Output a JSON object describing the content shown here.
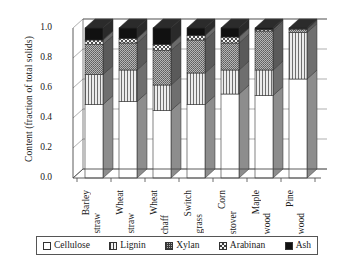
{
  "chart_data": {
    "type": "bar",
    "subtype": "stacked-bar-3d",
    "title": "",
    "xlabel": "",
    "ylabel": "Content (fraction of total solids)",
    "ylim": [
      0.0,
      1.0
    ],
    "yticks": [
      "0.0",
      "0.2",
      "0.4",
      "0.6",
      "0.8",
      "1.0"
    ],
    "ytick_values": [
      0.0,
      0.2,
      0.4,
      0.6,
      0.8,
      1.0
    ],
    "grid": true,
    "grid_axis": "y",
    "legend_position": "bottom",
    "stacked": true,
    "stack_total": 1.0,
    "categories": [
      "Barley straw",
      "Wheat straw",
      "Wheat chaff",
      "Switch grass",
      "Corn stover",
      "Maple wood",
      "Pine wood"
    ],
    "categories_lines": [
      [
        "Barley",
        "straw"
      ],
      [
        "Wheat",
        "straw"
      ],
      [
        "Wheat",
        "chaff"
      ],
      [
        "Switch",
        "grass"
      ],
      [
        "Corn",
        "stover"
      ],
      [
        "Maple",
        "wood"
      ],
      [
        "Pine",
        "wood"
      ]
    ],
    "series": [
      {
        "name": "Cellulose",
        "pattern": "solid-white",
        "color": "#ffffff",
        "values": [
          0.49,
          0.51,
          0.45,
          0.49,
          0.56,
          0.55,
          0.66
        ]
      },
      {
        "name": "Lignin",
        "pattern": "vertical-lines",
        "color": "#d8d8d8",
        "values": [
          0.2,
          0.21,
          0.17,
          0.21,
          0.16,
          0.17,
          0.31
        ]
      },
      {
        "name": "Xylan",
        "pattern": "fine-dots",
        "color": "#9a9a9a",
        "values": [
          0.2,
          0.18,
          0.23,
          0.22,
          0.18,
          0.26,
          0.02
        ]
      },
      {
        "name": "Arabinan",
        "pattern": "checkered",
        "color": "#c4c4c4",
        "values": [
          0.03,
          0.03,
          0.04,
          0.03,
          0.04,
          0.01,
          0.005
        ]
      },
      {
        "name": "Ash",
        "pattern": "solid-black",
        "color": "#111111",
        "values": [
          0.08,
          0.07,
          0.11,
          0.05,
          0.06,
          0.01,
          0.005
        ]
      }
    ],
    "cumulative_tops": {
      "Barley straw": [
        0.49,
        0.69,
        0.89,
        0.92,
        1.0
      ],
      "Wheat straw": [
        0.51,
        0.72,
        0.9,
        0.93,
        1.0
      ],
      "Wheat chaff": [
        0.45,
        0.62,
        0.85,
        0.89,
        1.0
      ],
      "Switch grass": [
        0.49,
        0.7,
        0.92,
        0.95,
        1.0
      ],
      "Corn stover": [
        0.56,
        0.72,
        0.9,
        0.94,
        1.0
      ],
      "Maple wood": [
        0.55,
        0.72,
        0.98,
        0.99,
        1.0
      ],
      "Pine wood": [
        0.66,
        0.97,
        0.99,
        0.995,
        1.0
      ]
    }
  },
  "legend": {
    "items": [
      {
        "label": "Cellulose",
        "pattern": "solid-white"
      },
      {
        "label": "Lignin",
        "pattern": "vertical-lines"
      },
      {
        "label": "Xylan",
        "pattern": "fine-dots"
      },
      {
        "label": "Arabinan",
        "pattern": "checkered"
      },
      {
        "label": "Ash",
        "pattern": "solid-black"
      }
    ]
  },
  "colors": {
    "axis": "#4a4a4a",
    "grid": "#8c8c8c",
    "cellulose": "#ffffff",
    "lignin": "#dcdcdc",
    "xylan": "#9a9a9a",
    "arabinan": "#c8c8c8",
    "ash": "#111111",
    "side_face": "#6b6b6b",
    "top_face": "#2b2b2b"
  }
}
